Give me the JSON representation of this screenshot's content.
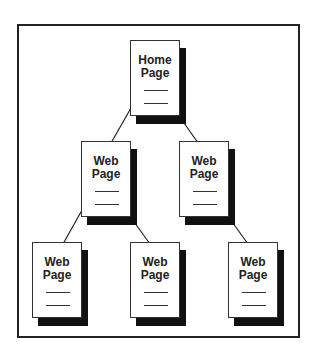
{
  "diagram": {
    "type": "site-hierarchy",
    "nodes": [
      {
        "id": "home",
        "line1": "Home",
        "line2": "Page",
        "level": 0
      },
      {
        "id": "web-l1-a",
        "line1": "Web",
        "line2": "Page",
        "level": 1
      },
      {
        "id": "web-l1-b",
        "line1": "Web",
        "line2": "Page",
        "level": 1
      },
      {
        "id": "web-l2-a",
        "line1": "Web",
        "line2": "Page",
        "level": 2
      },
      {
        "id": "web-l2-b",
        "line1": "Web",
        "line2": "Page",
        "level": 2
      },
      {
        "id": "web-l2-c",
        "line1": "Web",
        "line2": "Page",
        "level": 2
      }
    ],
    "edges": [
      {
        "from": "home",
        "to": "web-l1-a"
      },
      {
        "from": "home",
        "to": "web-l1-b"
      },
      {
        "from": "web-l1-a",
        "to": "web-l2-a"
      },
      {
        "from": "web-l1-a",
        "to": "web-l2-b"
      },
      {
        "from": "web-l1-b",
        "to": "web-l2-c"
      }
    ]
  }
}
